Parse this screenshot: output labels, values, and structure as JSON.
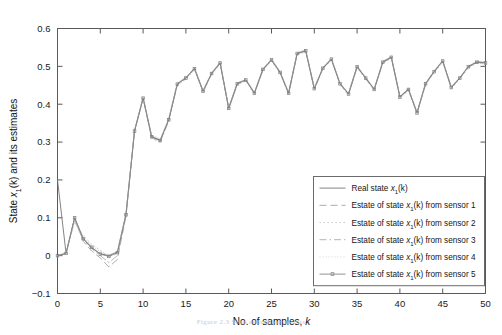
{
  "chart_data": {
    "type": "line",
    "title": "",
    "xlabel": "No. of samples, k",
    "ylabel": "State x1(k) and its estimates",
    "xlim": [
      0,
      50
    ],
    "ylim": [
      -0.1,
      0.6
    ],
    "xticks": [
      0,
      5,
      10,
      15,
      20,
      25,
      30,
      35,
      40,
      45,
      50
    ],
    "xtick_labels": [
      "0",
      "5",
      "10",
      "15",
      "20",
      "25",
      "30",
      "35",
      "40",
      "45",
      "50"
    ],
    "yticks": [
      -0.1,
      0,
      0.1,
      0.2,
      0.3,
      0.4,
      0.5,
      0.6
    ],
    "ytick_labels": [
      "-0.1",
      "0",
      "0.1",
      "0.2",
      "0.3",
      "0.4",
      "0.5",
      "0.6"
    ],
    "grid": false,
    "legend_position": "lower right",
    "x": [
      0,
      1,
      2,
      3,
      4,
      5,
      6,
      7,
      8,
      9,
      10,
      11,
      12,
      13,
      14,
      15,
      16,
      17,
      18,
      19,
      20,
      21,
      22,
      23,
      24,
      25,
      26,
      27,
      28,
      29,
      30,
      31,
      32,
      33,
      34,
      35,
      36,
      37,
      38,
      39,
      40,
      41,
      42,
      43,
      44,
      45,
      46,
      47,
      48,
      49,
      50
    ],
    "series": [
      {
        "name": "Real state x1(k)",
        "style": "solid",
        "marker": "none",
        "color": "#6e6e6e",
        "values": [
          0.2,
          0.006,
          0.1,
          0.045,
          0.02,
          0.005,
          0.0,
          0.01,
          0.11,
          0.33,
          0.417,
          0.315,
          0.305,
          0.36,
          0.455,
          0.47,
          0.495,
          0.435,
          0.482,
          0.51,
          0.39,
          0.455,
          0.465,
          0.43,
          0.493,
          0.518,
          0.485,
          0.43,
          0.535,
          0.542,
          0.442,
          0.496,
          0.52,
          0.455,
          0.428,
          0.5,
          0.47,
          0.44,
          0.512,
          0.525,
          0.42,
          0.44,
          0.378,
          0.455,
          0.487,
          0.515,
          0.445,
          0.47,
          0.5,
          0.512,
          0.51
        ]
      },
      {
        "name": "Estate of state x1(k) from sensor 1",
        "style": "dashed",
        "marker": "none",
        "color": "#9a9a9a",
        "values": [
          0.0,
          0.006,
          0.098,
          0.038,
          0.012,
          -0.006,
          -0.03,
          -0.01,
          0.105,
          0.328,
          0.415,
          0.312,
          0.302,
          0.358,
          0.452,
          0.468,
          0.493,
          0.433,
          0.48,
          0.508,
          0.388,
          0.453,
          0.463,
          0.428,
          0.491,
          0.516,
          0.483,
          0.428,
          0.533,
          0.54,
          0.44,
          0.494,
          0.518,
          0.453,
          0.426,
          0.498,
          0.468,
          0.438,
          0.51,
          0.523,
          0.418,
          0.438,
          0.376,
          0.453,
          0.485,
          0.513,
          0.443,
          0.468,
          0.498,
          0.51,
          0.508
        ]
      },
      {
        "name": "Estate of state x1(k) from sensor 2",
        "style": "dotted",
        "marker": "none",
        "color": "#c2c2c2",
        "values": [
          0.0,
          0.008,
          0.095,
          0.052,
          0.03,
          0.014,
          -0.002,
          0.005,
          0.108,
          0.326,
          0.413,
          0.316,
          0.307,
          0.362,
          0.45,
          0.466,
          0.491,
          0.431,
          0.478,
          0.506,
          0.386,
          0.451,
          0.461,
          0.426,
          0.489,
          0.514,
          0.481,
          0.426,
          0.531,
          0.538,
          0.438,
          0.492,
          0.516,
          0.451,
          0.424,
          0.496,
          0.466,
          0.436,
          0.508,
          0.521,
          0.416,
          0.436,
          0.374,
          0.451,
          0.483,
          0.511,
          0.441,
          0.466,
          0.496,
          0.508,
          0.506
        ]
      },
      {
        "name": "Estate of state x1(k) from sensor 3",
        "style": "dashdot",
        "marker": "none",
        "color": "#a8a8a8",
        "values": [
          0.0,
          0.005,
          0.092,
          0.041,
          0.018,
          0.0,
          -0.018,
          0.0,
          0.104,
          0.33,
          0.418,
          0.31,
          0.3,
          0.356,
          0.454,
          0.47,
          0.495,
          0.435,
          0.482,
          0.51,
          0.39,
          0.455,
          0.465,
          0.43,
          0.493,
          0.518,
          0.485,
          0.43,
          0.535,
          0.542,
          0.442,
          0.496,
          0.52,
          0.455,
          0.428,
          0.5,
          0.47,
          0.44,
          0.512,
          0.525,
          0.42,
          0.44,
          0.378,
          0.455,
          0.487,
          0.515,
          0.445,
          0.47,
          0.5,
          0.512,
          0.51
        ]
      },
      {
        "name": "Estate of state x1(k) from sensor 4",
        "style": "fine-dotted",
        "marker": "none",
        "color": "#d0d0d0",
        "values": [
          0.0,
          0.01,
          0.09,
          0.048,
          0.026,
          0.01,
          0.002,
          0.012,
          0.112,
          0.332,
          0.42,
          0.318,
          0.309,
          0.364,
          0.456,
          0.472,
          0.497,
          0.437,
          0.484,
          0.512,
          0.392,
          0.457,
          0.467,
          0.432,
          0.495,
          0.52,
          0.487,
          0.432,
          0.537,
          0.544,
          0.444,
          0.498,
          0.522,
          0.457,
          0.43,
          0.502,
          0.472,
          0.442,
          0.514,
          0.527,
          0.422,
          0.442,
          0.38,
          0.457,
          0.489,
          0.517,
          0.447,
          0.472,
          0.502,
          0.514,
          0.512
        ]
      },
      {
        "name": "Estate of state x1(k) from sensor 5",
        "style": "solid-marker",
        "marker": "square",
        "color": "#7d7d7d",
        "values": [
          0.0,
          0.006,
          0.1,
          0.045,
          0.022,
          0.004,
          -0.002,
          0.008,
          0.108,
          0.329,
          0.416,
          0.314,
          0.304,
          0.359,
          0.453,
          0.469,
          0.494,
          0.434,
          0.481,
          0.509,
          0.389,
          0.454,
          0.464,
          0.429,
          0.492,
          0.517,
          0.484,
          0.429,
          0.534,
          0.541,
          0.441,
          0.495,
          0.519,
          0.454,
          0.427,
          0.499,
          0.469,
          0.439,
          0.511,
          0.524,
          0.419,
          0.439,
          0.377,
          0.454,
          0.486,
          0.514,
          0.444,
          0.469,
          0.499,
          0.511,
          0.509
        ]
      }
    ]
  },
  "axis": {
    "ylabel_prefix": "State ",
    "ylabel_var": "x",
    "ylabel_sub": "1",
    "ylabel_suffix": "(k) and its estimates",
    "xlabel_prefix": "No. of samples, ",
    "xlabel_var": "k"
  },
  "legend": {
    "entries": [
      {
        "prefix": "Real state ",
        "var": "x",
        "sub": "1",
        "suffix": "(k)"
      },
      {
        "prefix": "Estate of state ",
        "var": "x",
        "sub": "1",
        "suffix": "(k) from sensor 1"
      },
      {
        "prefix": "Estate of state ",
        "var": "x",
        "sub": "1",
        "suffix": "(k) from sensor 2"
      },
      {
        "prefix": "Estate of state ",
        "var": "x",
        "sub": "1",
        "suffix": "(k) from sensor 3"
      },
      {
        "prefix": "Estate of state ",
        "var": "x",
        "sub": "1",
        "suffix": "(k) from sensor 4"
      },
      {
        "prefix": "Estate of state ",
        "var": "x",
        "sub": "1",
        "suffix": "(k) from sensor 5"
      }
    ]
  },
  "caption": {
    "text": "Figure 2.3   Scan estimation results"
  }
}
